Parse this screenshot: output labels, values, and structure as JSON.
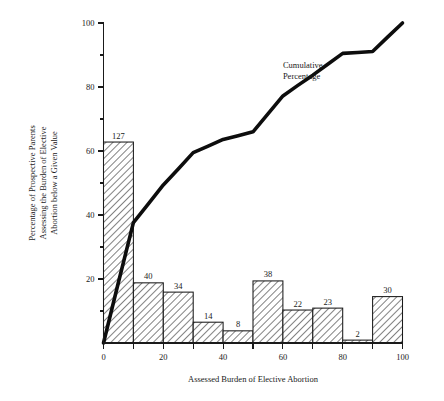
{
  "chart_data": {
    "type": "bar",
    "title": "",
    "subtitle": "",
    "xlabel": "Assessed Burden of Elective Abortion",
    "ylabel": "Percentage of Prospective Parents Assessing the Burden of Elective Abortion below a Given Value",
    "ylabel_lines": [
      "Percentage of Prospective Parents",
      "Assessing the Burden of Elective",
      "Abortion below a Given Value"
    ],
    "xlim": [
      0,
      100
    ],
    "ylim": [
      0,
      100
    ],
    "grid": false,
    "legend_position": "none",
    "x_ticks_major": [
      0,
      20,
      40,
      60,
      80,
      100
    ],
    "x_tick_labels": [
      "0",
      "20",
      "40",
      "60",
      "80",
      "100"
    ],
    "x_ticks_minor": [
      10,
      30,
      50,
      70,
      90
    ],
    "y_ticks_major": [
      20,
      40,
      60,
      80,
      100
    ],
    "y_tick_labels": [
      "20",
      "40",
      "60",
      "80",
      "100"
    ],
    "y_ticks_minor": [
      10,
      30,
      50,
      70,
      90
    ],
    "bin_width": 10,
    "bin_starts": [
      0,
      10,
      20,
      30,
      40,
      50,
      60,
      70,
      80,
      90
    ],
    "bin_ranges": [
      "0-10",
      "10-20",
      "20-30",
      "30-40",
      "40-50",
      "50-60",
      "60-70",
      "70-80",
      "80-90",
      "90-100"
    ],
    "counts": [
      127,
      40,
      34,
      14,
      8,
      38,
      22,
      23,
      2,
      30
    ],
    "count_labels": [
      "127",
      "40",
      "34",
      "14",
      "8",
      "38",
      "22",
      "23",
      "2",
      "30"
    ],
    "values": [
      62.8,
      18.8,
      15.9,
      6.5,
      3.8,
      19.4,
      10.3,
      10.9,
      0.9,
      14.5
    ],
    "total_count": 338,
    "bar_fill_pattern": "diagonal-hatch",
    "bar_edge_color": "#1a1a1a",
    "series": [
      {
        "name": "Cumulative Percentage",
        "type": "line",
        "x": [
          0,
          5,
          10,
          15,
          20,
          25,
          30,
          35,
          40,
          45,
          50,
          55,
          60,
          65,
          70,
          75,
          80,
          85,
          90,
          95,
          100
        ],
        "values": [
          0,
          19,
          37.6,
          43.5,
          49.4,
          54.4,
          59.5,
          61.5,
          63.6,
          64.8,
          66.0,
          71.6,
          77.2,
          80.5,
          83.7,
          87.1,
          90.5,
          90.8,
          91.1,
          95.6,
          100
        ],
        "color": "#0d0d0d"
      }
    ],
    "annotations": [
      {
        "text": "Cumulative\nPercentage",
        "lines": [
          "Cumulative",
          "Percentage"
        ],
        "x": 60,
        "y": 86
      }
    ]
  },
  "figure": {
    "background_color": "#ffffff",
    "text_color": "#1a1a1a"
  }
}
